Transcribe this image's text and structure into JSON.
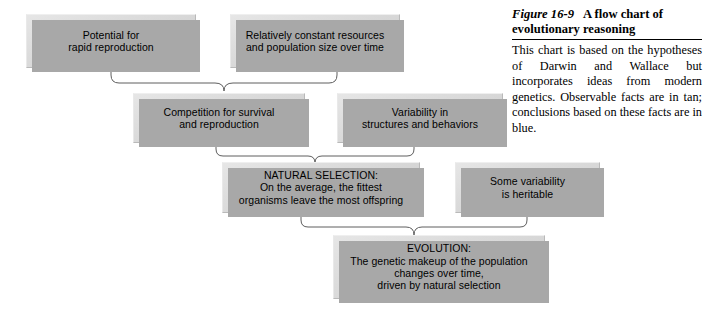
{
  "figure": {
    "caption": {
      "figure_number": "Figure 16-9",
      "title": "A flow chart of evolutionary reasoning",
      "body": "This chart is based on the hypotheses of Darwin and Wallace but incorporates ideas from modern genetics. Observable facts are in tan; conclusions based on these facts are in blue."
    },
    "colors": {
      "box_fill": "#dcdcdc",
      "box_shadow": "#a8a8a8",
      "box_border": "#b9b9b9",
      "connector": "#5e5e5e",
      "background": "#ffffff",
      "text": "#000000"
    },
    "nodes": [
      {
        "id": "potential-for-rapid-reproduction",
        "text": "Potential for\nrapid reproduction",
        "x": 26,
        "y": 14,
        "w": 170,
        "h": 54
      },
      {
        "id": "relatively-constant-resources",
        "text": "Relatively constant resources\nand population size over time",
        "x": 230,
        "y": 14,
        "w": 170,
        "h": 54
      },
      {
        "id": "competition-for-survival",
        "text": "Competition for survival\nand reproduction",
        "x": 133,
        "y": 93,
        "w": 172,
        "h": 50
      },
      {
        "id": "variability-in-structures-and-behaviors",
        "text": "Variability in\nstructures and behaviors",
        "x": 337,
        "y": 93,
        "w": 166,
        "h": 50
      },
      {
        "id": "natural-selection",
        "text": "NATURAL SELECTION:\nOn the average, the fittest\norganisms leave the most offspring",
        "x": 222,
        "y": 162,
        "w": 198,
        "h": 51
      },
      {
        "id": "some-variability-is-heritable",
        "text": "Some variability\nis heritable",
        "x": 455,
        "y": 162,
        "w": 145,
        "h": 51
      },
      {
        "id": "evolution",
        "text": "EVOLUTION:\nThe genetic makeup of the population\nchanges over time,\ndriven by natural selection",
        "x": 333,
        "y": 235,
        "w": 212,
        "h": 64
      }
    ],
    "connectors": [
      {
        "id": "top-pair-to-competition",
        "from": [
          "potential-for-rapid-reproduction",
          "relatively-constant-resources"
        ],
        "to": "competition-for-survival"
      },
      {
        "id": "middle-pair-to-natural-selection",
        "from": [
          "competition-for-survival",
          "variability-in-structures-and-behaviors"
        ],
        "to": "natural-selection"
      },
      {
        "id": "lower-pair-to-evolution",
        "from": [
          "natural-selection",
          "some-variability-is-heritable"
        ],
        "to": "evolution"
      }
    ]
  }
}
